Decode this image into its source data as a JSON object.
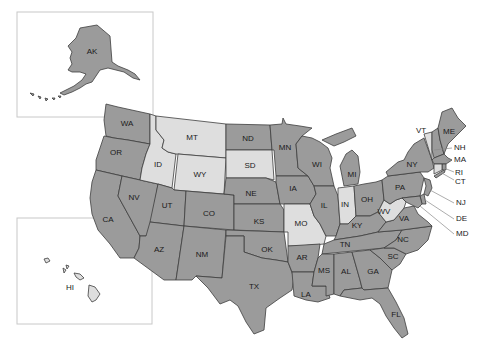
{
  "map": {
    "title": "United States",
    "colors": {
      "dark": "#9b9b9b",
      "light": "#dedede",
      "border": "#3d3d3d",
      "inset_border": "#c8c8c8"
    },
    "states": [
      {
        "code": "AK",
        "shade": "dark"
      },
      {
        "code": "HI",
        "shade": "light"
      },
      {
        "code": "WA",
        "shade": "dark"
      },
      {
        "code": "OR",
        "shade": "dark"
      },
      {
        "code": "CA",
        "shade": "dark"
      },
      {
        "code": "NV",
        "shade": "dark"
      },
      {
        "code": "ID",
        "shade": "light"
      },
      {
        "code": "MT",
        "shade": "light"
      },
      {
        "code": "WY",
        "shade": "light"
      },
      {
        "code": "UT",
        "shade": "dark"
      },
      {
        "code": "AZ",
        "shade": "dark"
      },
      {
        "code": "CO",
        "shade": "dark"
      },
      {
        "code": "NM",
        "shade": "dark"
      },
      {
        "code": "ND",
        "shade": "dark"
      },
      {
        "code": "SD",
        "shade": "light"
      },
      {
        "code": "NE",
        "shade": "dark"
      },
      {
        "code": "KS",
        "shade": "dark"
      },
      {
        "code": "OK",
        "shade": "dark"
      },
      {
        "code": "TX",
        "shade": "dark"
      },
      {
        "code": "MN",
        "shade": "dark"
      },
      {
        "code": "IA",
        "shade": "dark"
      },
      {
        "code": "MO",
        "shade": "light"
      },
      {
        "code": "AR",
        "shade": "dark"
      },
      {
        "code": "LA",
        "shade": "dark"
      },
      {
        "code": "WI",
        "shade": "dark"
      },
      {
        "code": "IL",
        "shade": "dark"
      },
      {
        "code": "MI",
        "shade": "dark"
      },
      {
        "code": "IN",
        "shade": "light"
      },
      {
        "code": "OH",
        "shade": "dark"
      },
      {
        "code": "KY",
        "shade": "dark"
      },
      {
        "code": "TN",
        "shade": "dark"
      },
      {
        "code": "MS",
        "shade": "dark"
      },
      {
        "code": "AL",
        "shade": "dark"
      },
      {
        "code": "GA",
        "shade": "dark"
      },
      {
        "code": "FL",
        "shade": "dark"
      },
      {
        "code": "SC",
        "shade": "dark"
      },
      {
        "code": "NC",
        "shade": "dark"
      },
      {
        "code": "VA",
        "shade": "dark"
      },
      {
        "code": "WV",
        "shade": "light"
      },
      {
        "code": "PA",
        "shade": "dark"
      },
      {
        "code": "NY",
        "shade": "dark"
      },
      {
        "code": "VT",
        "shade": "light"
      },
      {
        "code": "NH",
        "shade": "dark"
      },
      {
        "code": "ME",
        "shade": "dark"
      },
      {
        "code": "MA",
        "shade": "dark"
      },
      {
        "code": "RI",
        "shade": "dark"
      },
      {
        "code": "CT",
        "shade": "light"
      },
      {
        "code": "NJ",
        "shade": "dark"
      },
      {
        "code": "DE",
        "shade": "dark"
      },
      {
        "code": "MD",
        "shade": "dark"
      }
    ],
    "labels": {
      "AK": "AK",
      "HI": "HI",
      "WA": "WA",
      "OR": "OR",
      "CA": "CA",
      "NV": "NV",
      "ID": "ID",
      "MT": "MT",
      "WY": "WY",
      "UT": "UT",
      "AZ": "AZ",
      "CO": "CO",
      "NM": "NM",
      "ND": "ND",
      "SD": "SD",
      "NE": "NE",
      "KS": "KS",
      "OK": "OK",
      "TX": "TX",
      "MN": "MN",
      "IA": "IA",
      "MO": "MO",
      "AR": "AR",
      "LA": "LA",
      "WI": "WI",
      "IL": "IL",
      "MI": "MI",
      "IN": "IN",
      "OH": "OH",
      "KY": "KY",
      "TN": "TN",
      "MS": "MS",
      "AL": "AL",
      "GA": "GA",
      "FL": "FL",
      "SC": "SC",
      "NC": "NC",
      "VA": "VA",
      "WV": "WV",
      "PA": "PA",
      "NY": "NY",
      "VT": "VT",
      "NH": "NH",
      "ME": "ME",
      "MA": "MA",
      "RI": "RI",
      "CT": "CT",
      "NJ": "NJ",
      "DE": "DE",
      "MD": "MD"
    }
  }
}
